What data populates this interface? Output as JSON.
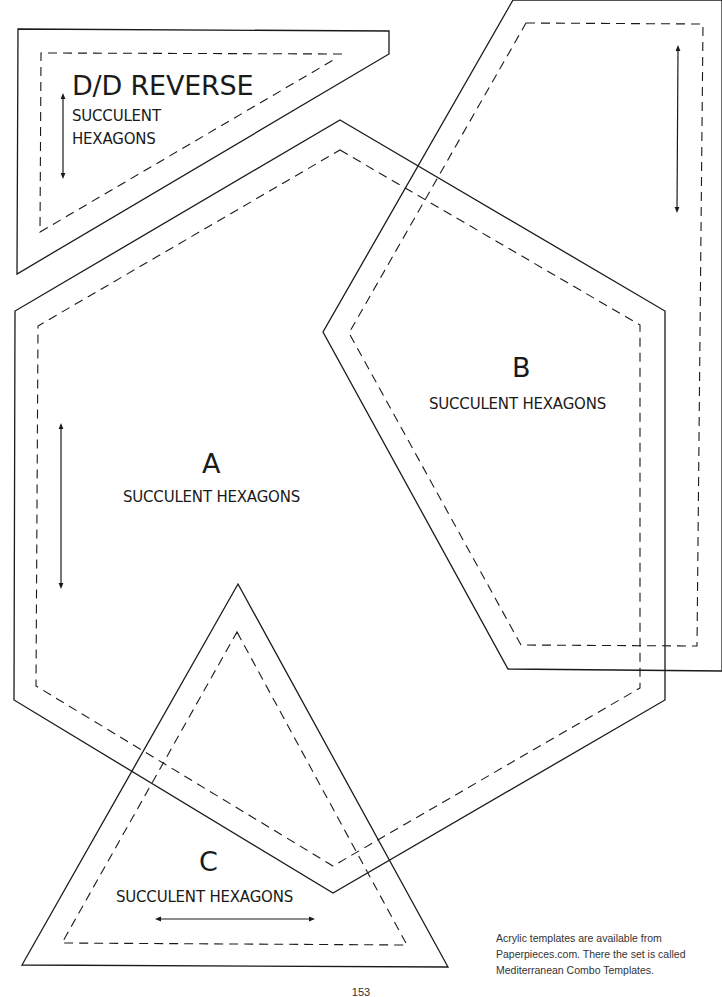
{
  "templates": {
    "dd_reverse": {
      "title": "D/D REVERSE",
      "subtitle_line1": "SUCCULENT",
      "subtitle_line2": "HEXAGONS",
      "grain": "vertical"
    },
    "a": {
      "letter": "A",
      "subtitle": "SUCCULENT HEXAGONS",
      "grain": "vertical"
    },
    "b": {
      "letter": "B",
      "subtitle": "SUCCULENT HEXAGONS",
      "grain": "vertical"
    },
    "c": {
      "letter": "C",
      "subtitle": "SUCCULENT HEXAGONS",
      "grain": "horizontal"
    }
  },
  "note": {
    "line1": "Acrylic templates are available from",
    "line2": "Paperpieces.com. There the set is called",
    "line3": "Mediterranean Combo Templates."
  },
  "page_number": "153",
  "colors": {
    "ink": "#1a1a1a",
    "paper": "#ffffff"
  }
}
